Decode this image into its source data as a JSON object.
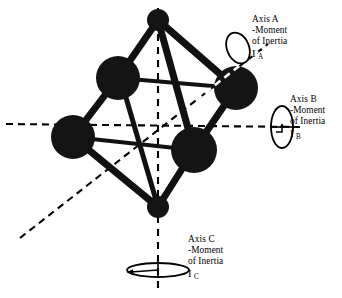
{
  "figure": {
    "background_color": "#ffffff",
    "ink_color": "#000000",
    "atom_color": "#1a1a1a"
  },
  "labels": {
    "axis_a": {
      "name": "Axis A",
      "line1": "Axis A",
      "line2": "-Moment",
      "line3": "of Inertia",
      "symbol": "I",
      "subscript": "A"
    },
    "axis_b": {
      "name": "Axis B",
      "line1": "Axis B",
      "line2": "-Moment",
      "line3": "of Inertia",
      "symbol": "I",
      "subscript": "B"
    },
    "axis_c": {
      "name": "Axis C",
      "line1": "Axis C",
      "line2": "-Moment",
      "line3": "of Inertia",
      "symbol": "I",
      "subscript": "C"
    }
  },
  "molecule": {
    "atoms": [
      {
        "id": "apex-top",
        "cx": 158,
        "cy": 20,
        "r": 11
      },
      {
        "id": "equatorial-upper-left",
        "cx": 118,
        "cy": 78,
        "r": 22
      },
      {
        "id": "equatorial-upper-right",
        "cx": 236,
        "cy": 88,
        "r": 22
      },
      {
        "id": "equatorial-lower-left",
        "cx": 73,
        "cy": 137,
        "r": 22
      },
      {
        "id": "equatorial-front",
        "cx": 194,
        "cy": 150,
        "r": 23
      },
      {
        "id": "apex-bottom",
        "cx": 158,
        "cy": 207,
        "r": 11
      }
    ],
    "bonds": [
      {
        "from": "apex-top",
        "to": "equatorial-upper-left",
        "width": 7
      },
      {
        "from": "apex-top",
        "to": "equatorial-upper-right",
        "width": 7
      },
      {
        "from": "apex-top",
        "to": "equatorial-front",
        "width": 7
      },
      {
        "from": "equatorial-upper-left",
        "to": "equatorial-upper-right",
        "width": 4
      },
      {
        "from": "equatorial-upper-left",
        "to": "equatorial-lower-left",
        "width": 7
      },
      {
        "from": "equatorial-upper-right",
        "to": "equatorial-front",
        "width": 7
      },
      {
        "from": "equatorial-lower-left",
        "to": "equatorial-front",
        "width": 4
      },
      {
        "from": "equatorial-lower-left",
        "to": "apex-bottom",
        "width": 7
      },
      {
        "from": "equatorial-front",
        "to": "apex-bottom",
        "width": 7
      },
      {
        "from": "equatorial-upper-left",
        "to": "apex-bottom",
        "width": 5
      }
    ]
  },
  "axes": [
    {
      "id": "axis-a",
      "name": "Axis A",
      "x1": 20,
      "y1": 238,
      "x2": 268,
      "y2": 44,
      "dash": "7 5",
      "rotation_marker": {
        "cx": 238,
        "cy": 48,
        "rx": 11,
        "ry": 16,
        "rotate": -22
      }
    },
    {
      "id": "axis-b",
      "name": "Axis B",
      "x1": 6,
      "y1": 124,
      "x2": 300,
      "y2": 127,
      "dash": "7 5",
      "rotation_marker": {
        "cx": 282,
        "cy": 127,
        "rx": 11,
        "ry": 21,
        "rotate": 0
      }
    },
    {
      "id": "axis-c",
      "name": "Axis C",
      "x1": 158,
      "y1": 8,
      "x2": 158,
      "y2": 292,
      "dash": "7 6",
      "rotation_marker": {
        "cx": 158,
        "cy": 270,
        "rx": 31,
        "ry": 7,
        "rotate": 0
      }
    }
  ]
}
